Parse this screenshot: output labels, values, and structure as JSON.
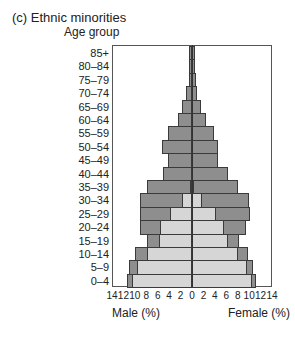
{
  "chart_data": {
    "type": "bar",
    "title": "(c) Ethnic minorities",
    "ylabel": "Age group",
    "xlabel_left": "Male (%)",
    "xlabel_right": "Female (%)",
    "xticks": [
      14,
      12,
      10,
      8,
      6,
      4,
      2,
      0,
      2,
      4,
      6,
      8,
      10,
      12,
      14
    ],
    "xlim": [
      -14,
      14
    ],
    "categories": [
      "85+",
      "80–84",
      "75–79",
      "70–74",
      "65–69",
      "60–64",
      "55–59",
      "50–54",
      "45–49",
      "40–44",
      "35–39",
      "30–34",
      "25–29",
      "20–24",
      "15–19",
      "10–14",
      "5–9",
      "0–4"
    ],
    "series": [
      {
        "name": "Male total",
        "values": [
          0.5,
          0.5,
          0.6,
          1.1,
          1.8,
          2.4,
          4.2,
          5.2,
          4.2,
          5.0,
          7.9,
          9.1,
          9.1,
          9.1,
          7.9,
          10.0,
          11.0,
          11.4
        ]
      },
      {
        "name": "Male (light segment)",
        "values": [
          0,
          0,
          0,
          0,
          0,
          0,
          0,
          0,
          0,
          0,
          0.3,
          1.7,
          3.9,
          5.6,
          5.8,
          7.9,
          9.6,
          10.5
        ]
      },
      {
        "name": "Female total",
        "values": [
          0.5,
          0.5,
          0.7,
          0.9,
          1.6,
          2.4,
          3.9,
          4.6,
          4.6,
          6.3,
          8.1,
          10.0,
          10.2,
          9.5,
          8.2,
          9.8,
          10.7,
          11.2
        ]
      },
      {
        "name": "Female (light segment)",
        "values": [
          0,
          0,
          0,
          0,
          0,
          0,
          0,
          0,
          0,
          0,
          0.3,
          1.8,
          4.2,
          5.6,
          6.3,
          8.1,
          9.6,
          10.5
        ]
      }
    ],
    "colors": {
      "dark": "#8e8e8e",
      "light": "#d6d6d6",
      "border": "#3a3a3a"
    }
  }
}
